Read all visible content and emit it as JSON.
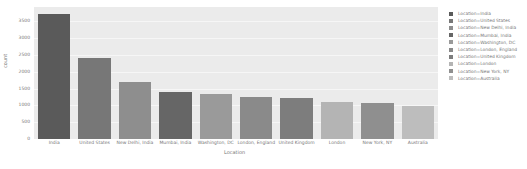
{
  "chart_data": {
    "type": "bar",
    "title": "",
    "xlabel": "Location",
    "ylabel": "count",
    "ylim": [
      0,
      3900
    ],
    "yticks": [
      0,
      500,
      1000,
      1500,
      2000,
      2500,
      3000,
      3500
    ],
    "grid": true,
    "legend_position": "right",
    "categories": [
      "India",
      "United States",
      "New Delhi, India",
      "Mumbai, India",
      "Washington, DC",
      "London, England",
      "United Kingdom",
      "London",
      "New York, NY",
      "Australia"
    ],
    "values": [
      3720,
      2420,
      1700,
      1385,
      1340,
      1260,
      1210,
      1090,
      1070,
      990
    ],
    "colors": [
      "#5a5a5a",
      "#777777",
      "#8e8e8e",
      "#666666",
      "#9a9a9a",
      "#8a8a8a",
      "#7d7d7d",
      "#b4b4b4",
      "#8f8f8f",
      "#bdbdbd"
    ],
    "legend": [
      "Location=India",
      "Location=United States",
      "Location=New Delhi, India",
      "Location=Mumbai, India",
      "Location=Washington, DC",
      "Location=London, England",
      "Location=United Kingdom",
      "Location=London",
      "Location=New York, NY",
      "Location=Australia"
    ]
  },
  "axes": {
    "ytick_labels": [
      "0",
      "500",
      "1000",
      "1500",
      "2000",
      "2500",
      "3000",
      "3500"
    ],
    "xlabel": "Location",
    "ylabel": "count"
  }
}
